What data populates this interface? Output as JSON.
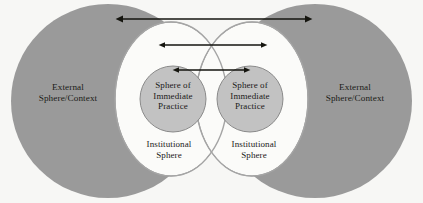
{
  "figure": {
    "background_color": "#f7f7f5",
    "colors": {
      "outer_sphere_gray": "#9a9a9a",
      "institutional_white": "#fbfbf9",
      "immediate_practice_gray": "#c2c2c2",
      "outline": "#8a8a8a",
      "arrow": "#15150f",
      "text": "#1a1a18"
    }
  },
  "labels": {
    "external_left": "External\nSphere/Context",
    "external_right": "External\nSphere/Context",
    "immediate_left": "Sphere of\nImmediate\nPractice",
    "immediate_right": "Sphere of\nImmediate\nPractice",
    "institutional_left": "Institutional\nSphere",
    "institutional_right": "Institutional\nSphere"
  },
  "shapes": {
    "external_left_circle": {
      "cx": 108,
      "cy": 101,
      "r": 97
    },
    "external_right_circle": {
      "cx": 315,
      "cy": 101,
      "r": 97
    },
    "institutional_left_ellipse": {
      "cx": 171,
      "cy": 99,
      "rx": 56,
      "ry": 77
    },
    "institutional_right_ellipse": {
      "cx": 252,
      "cy": 99,
      "rx": 56,
      "ry": 77
    },
    "immediate_left_circle": {
      "cx": 173,
      "cy": 99,
      "r": 33
    },
    "immediate_right_circle": {
      "cx": 250,
      "cy": 99,
      "r": 33
    }
  },
  "arrows": [
    {
      "name": "arrow-outer",
      "x1": 123,
      "x2": 305,
      "y": 19,
      "heads": "both",
      "stroke_width": 1.6
    },
    {
      "name": "arrow-middle",
      "x1": 165,
      "x2": 261,
      "y": 45,
      "heads": "both",
      "stroke_width": 1.3
    },
    {
      "name": "arrow-inner",
      "x1": 179,
      "x2": 244,
      "y": 70,
      "heads": "both",
      "stroke_width": 1.3
    }
  ]
}
